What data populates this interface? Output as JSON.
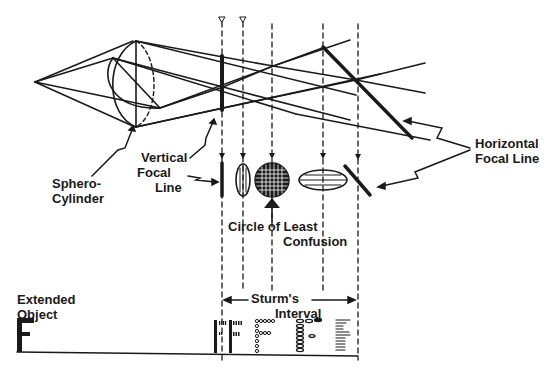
{
  "diagram": {
    "type": "optics-schematic",
    "colors": {
      "ink": "#1a1a1a",
      "background": "#ffffff"
    }
  },
  "labels": {
    "sphero_cylinder": [
      "Sphero-",
      "Cylinder"
    ],
    "vertical_focal_line": [
      "Vertical",
      "Focal",
      "Line"
    ],
    "horizontal_focal_line": [
      "Horizontal",
      "Focal Line"
    ],
    "circle_of_least_confusion": [
      "Circle of Least",
      "Confusion"
    ],
    "sturms_interval": [
      "Sturm's",
      "Interval"
    ],
    "extended_object": [
      "Extended",
      "Object"
    ],
    "object_letter": "F"
  },
  "cross_sections": [
    {
      "id": "vertical-line",
      "shape": "vertical line"
    },
    {
      "id": "vertical-ellipse",
      "shape": "vertical ellipse, vertical hatching"
    },
    {
      "id": "circle",
      "shape": "circle, cross hatching (circle of least confusion)"
    },
    {
      "id": "horizontal-ellipse",
      "shape": "horizontal ellipse, horizontal hatching"
    },
    {
      "id": "horizontal-line",
      "shape": "oblique line (horizontal focal line)"
    }
  ],
  "image_letters": [
    {
      "id": "F-at-vertical-line",
      "style": "vertical strokes"
    },
    {
      "id": "F-vertical-blur",
      "style": "vertical dashes"
    },
    {
      "id": "F-least-confusion",
      "style": "dots"
    },
    {
      "id": "F-horizontal-blur",
      "style": "horizontal ellipses"
    },
    {
      "id": "F-at-horizontal-line",
      "style": "horizontal strokes"
    }
  ]
}
